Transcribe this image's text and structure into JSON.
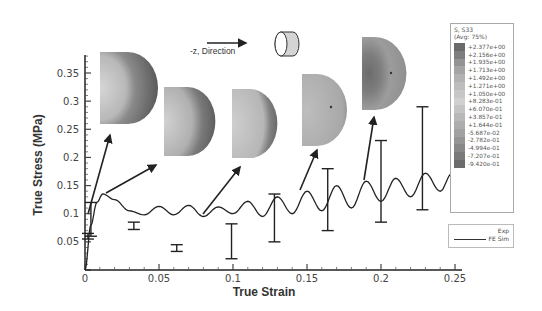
{
  "chart_data": {
    "type": "line",
    "title": "",
    "xlabel": "True Strain",
    "ylabel": "True Stress (MPa)",
    "xlim": [
      0,
      0.25
    ],
    "ylim": [
      0,
      0.38
    ],
    "x_ticks": [
      "0",
      "0.05",
      "0.1",
      "0.15",
      "0.2",
      "0.25"
    ],
    "y_ticks": [
      "0.05",
      "0.1",
      "0.15",
      "0.2",
      "0.25",
      "0.3",
      "0.35"
    ],
    "grid": false,
    "legend_position": "lower right",
    "series": [
      {
        "name": "FE Sim",
        "style": "line",
        "x": [
          0,
          0.004,
          0.008,
          0.012,
          0.02,
          0.03,
          0.04,
          0.05,
          0.06,
          0.07,
          0.08,
          0.09,
          0.1,
          0.11,
          0.12,
          0.13,
          0.14,
          0.15,
          0.16,
          0.17,
          0.18,
          0.19,
          0.2,
          0.21,
          0.22,
          0.23,
          0.24,
          0.248
        ],
        "values": [
          0,
          0.08,
          0.12,
          0.135,
          0.125,
          0.105,
          0.098,
          0.113,
          0.098,
          0.115,
          0.095,
          0.112,
          0.1,
          0.122,
          0.095,
          0.13,
          0.1,
          0.14,
          0.105,
          0.15,
          0.11,
          0.158,
          0.122,
          0.163,
          0.13,
          0.172,
          0.14,
          0.172
        ]
      },
      {
        "name": "Exp",
        "style": "error_bars",
        "x": [
          0.002,
          0.004,
          0.033,
          0.062,
          0.099,
          0.128,
          0.164,
          0.2,
          0.228
        ],
        "low": [
          0.055,
          0.06,
          0.072,
          0.033,
          0.02,
          0.05,
          0.07,
          0.085,
          0.107
        ],
        "high": [
          0.065,
          0.12,
          0.085,
          0.045,
          0.082,
          0.135,
          0.18,
          0.23,
          0.29
        ]
      }
    ],
    "annotations": [
      {
        "text": "-z, Direction",
        "type": "arrow-label"
      }
    ],
    "contour_insets": [
      {
        "x": 0.012,
        "y": 0.135
      },
      {
        "x": 0.045,
        "y": 0.12
      },
      {
        "x": 0.085,
        "y": 0.1
      },
      {
        "x": 0.145,
        "y": 0.15
      },
      {
        "x": 0.19,
        "y": 0.16
      }
    ]
  },
  "annotation": {
    "direction_label": "-z, Direction"
  },
  "contour_legend": {
    "title_line1": "S, S33",
    "title_line2": "(Avg: 75%)",
    "values": [
      "+2.377e+00",
      "+2.156e+00",
      "+1.935e+00",
      "+1.713e+00",
      "+1.492e+00",
      "+1.271e+00",
      "+1.050e+00",
      "+8.283e-01",
      "+6.070e-01",
      "+3.857e-01",
      "+1.644e-01",
      "-5.687e-02",
      "-2.782e-01",
      "-4.994e-01",
      "-7.207e-01",
      "-9.420e-01"
    ],
    "swatch_colors": [
      "#6a6a6a",
      "#7e7e7e",
      "#939393",
      "#a4a4a4",
      "#b2b2b2",
      "#bdbdbd",
      "#c7c7c7",
      "#d0d0d0",
      "#c4c4c4",
      "#b8b8b8",
      "#adadad",
      "#a2a2a2",
      "#959595",
      "#888888",
      "#7a7a7a",
      "#6c6c6c"
    ]
  },
  "series_legend": {
    "exp": "Exp",
    "fe": "FE Sim"
  },
  "axes": {
    "xlabel": "True Strain",
    "ylabel": "True Stress (MPa)"
  }
}
